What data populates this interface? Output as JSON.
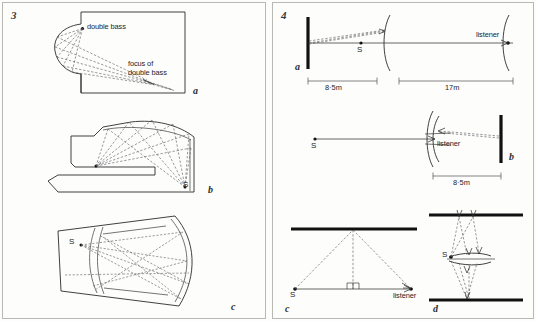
{
  "figure": {
    "left_panel": {
      "number": "3",
      "subfigures": [
        {
          "id": "a",
          "label": "a",
          "annotations": [
            {
              "name": "source-label",
              "text": "double bass"
            },
            {
              "name": "focus-label",
              "text": "focus of\ndouble bass"
            }
          ]
        },
        {
          "id": "b",
          "label": "b",
          "annotations": [
            {
              "name": "source-label",
              "text": "S"
            }
          ]
        },
        {
          "id": "c",
          "label": "c",
          "annotations": [
            {
              "name": "source-label",
              "text": "S"
            }
          ]
        }
      ]
    },
    "right_panel": {
      "number": "4",
      "subfigures": [
        {
          "id": "a",
          "label": "a",
          "annotations": [
            {
              "name": "source-label",
              "text": "S"
            },
            {
              "name": "listener-label",
              "text": "listener"
            }
          ],
          "dimensions": [
            {
              "name": "wall-to-arc",
              "text": "8·5m"
            },
            {
              "name": "arc-to-listener",
              "text": "17m"
            }
          ]
        },
        {
          "id": "b",
          "label": "b",
          "annotations": [
            {
              "name": "source-label",
              "text": "S"
            },
            {
              "name": "listener-label",
              "text": "listener"
            }
          ],
          "dimensions": [
            {
              "name": "listener-to-wall",
              "text": "8·5m"
            }
          ]
        },
        {
          "id": "c",
          "label": "c",
          "annotations": [
            {
              "name": "source-label",
              "text": "S"
            },
            {
              "name": "listener-label",
              "text": "listener"
            }
          ],
          "dimensions": []
        },
        {
          "id": "d",
          "label": "d",
          "annotations": [
            {
              "name": "source-label",
              "text": "S"
            }
          ],
          "dimensions": []
        }
      ]
    }
  },
  "style": {
    "ink": "#2b2b2b",
    "ray": "#55555b",
    "wall": "#111111",
    "paper": "#fdfdfc",
    "border": "#b9b9b4"
  }
}
